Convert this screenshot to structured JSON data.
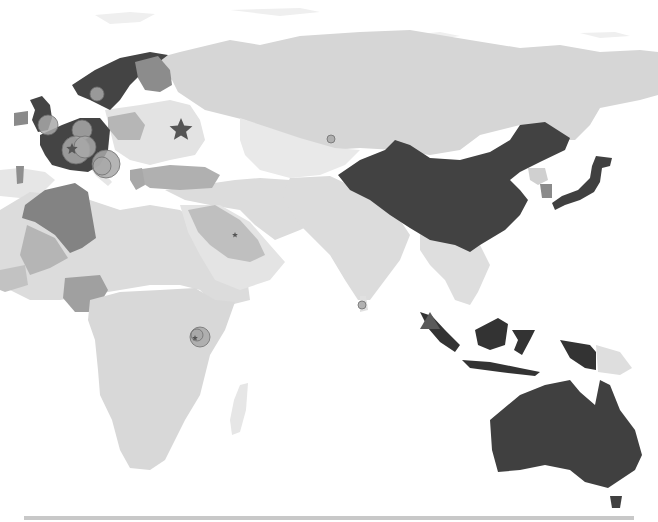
{
  "map": {
    "width": 658,
    "height": 522,
    "background": "#ffffff",
    "palette": {
      "ocean": "#ffffff",
      "arctic_ice": "#f2f2f2",
      "level_0": "#e6e6e6",
      "level_1": "#dadada",
      "level_2": "#d0d0d0",
      "level_3": "#9a9a9a",
      "level_4": "#8a8a8a",
      "level_5": "#3f3f3f",
      "marker_fill": "#a8a8a8",
      "marker_stroke": "#6e6e6e",
      "star_fill": "#555555",
      "triangle_fill": "#5a5a5a"
    },
    "regions": [
      {
        "name": "russia",
        "level": "level_2"
      },
      {
        "name": "china",
        "level": "level_5"
      },
      {
        "name": "australia",
        "level": "level_5"
      },
      {
        "name": "indonesia",
        "level": "level_5"
      },
      {
        "name": "japan",
        "level": "level_5"
      },
      {
        "name": "scandinavia",
        "level": "level_5"
      },
      {
        "name": "uk",
        "level": "level_5"
      },
      {
        "name": "france-germany",
        "level": "level_5"
      },
      {
        "name": "finland",
        "level": "level_3"
      },
      {
        "name": "south-korea",
        "level": "level_3"
      },
      {
        "name": "algeria",
        "level": "level_4"
      },
      {
        "name": "saudi-arabia",
        "level": "level_2"
      },
      {
        "name": "nigeria",
        "level": "level_3"
      },
      {
        "name": "africa",
        "level": "level_1"
      },
      {
        "name": "india",
        "level": "level_1"
      },
      {
        "name": "kazakhstan",
        "level": "level_0"
      },
      {
        "name": "madagascar",
        "level": "level_0"
      }
    ],
    "markers": [
      {
        "type": "circle",
        "x": 97,
        "y": 94,
        "r": 7
      },
      {
        "type": "circle",
        "x": 48,
        "y": 125,
        "r": 10
      },
      {
        "type": "circle",
        "x": 82,
        "y": 130,
        "r": 10
      },
      {
        "type": "circle",
        "x": 76,
        "y": 150,
        "r": 14
      },
      {
        "type": "circle",
        "x": 85,
        "y": 147,
        "r": 11
      },
      {
        "type": "circle",
        "x": 106,
        "y": 164,
        "r": 14
      },
      {
        "type": "circle",
        "x": 102,
        "y": 166,
        "r": 9
      },
      {
        "type": "circle",
        "x": 331,
        "y": 139,
        "r": 4
      },
      {
        "type": "circle",
        "x": 200,
        "y": 337,
        "r": 10
      },
      {
        "type": "circle",
        "x": 197,
        "y": 335,
        "r": 6
      },
      {
        "type": "circle",
        "x": 362,
        "y": 305,
        "r": 4
      },
      {
        "type": "star",
        "x": 181,
        "y": 130,
        "r": 12
      },
      {
        "type": "star",
        "x": 72,
        "y": 149,
        "r": 6
      },
      {
        "type": "star",
        "x": 235,
        "y": 235,
        "r": 3
      },
      {
        "type": "star",
        "x": 195,
        "y": 338,
        "r": 3
      },
      {
        "type": "triangle",
        "x": 430,
        "y": 322,
        "r": 10
      }
    ],
    "scrollbar_color": "#c8c8c8"
  }
}
